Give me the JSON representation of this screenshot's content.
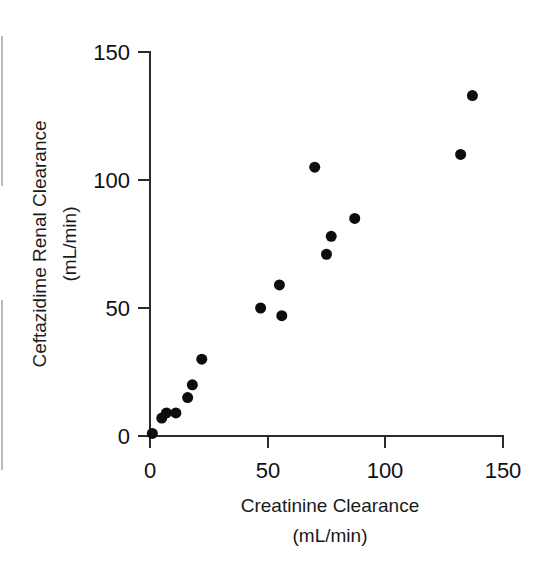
{
  "chart_data": {
    "type": "scatter",
    "title": "",
    "xlabel": "Creatinine Clearance",
    "xlabel_units": "(mL/min)",
    "ylabel": "Ceftazidime Renal Clearance",
    "ylabel_units": "(mL/min)",
    "xlim": [
      0,
      150
    ],
    "ylim": [
      0,
      150
    ],
    "xticks": [
      0,
      50,
      100,
      150
    ],
    "yticks": [
      0,
      50,
      100,
      150
    ],
    "xtick_labels": [
      "0",
      "50",
      "100",
      "150"
    ],
    "ytick_labels": [
      "0",
      "50",
      "100",
      "150"
    ],
    "grid": false,
    "legend": null,
    "marker": "filled-circle",
    "marker_color": "#0d0d0d",
    "marker_size_px": 11,
    "series": [
      {
        "name": "Ceftazidime renal clearance vs creatinine clearance",
        "points": [
          {
            "x": 1,
            "y": 1
          },
          {
            "x": 5,
            "y": 7
          },
          {
            "x": 7,
            "y": 9
          },
          {
            "x": 11,
            "y": 9
          },
          {
            "x": 16,
            "y": 15
          },
          {
            "x": 18,
            "y": 20
          },
          {
            "x": 22,
            "y": 30
          },
          {
            "x": 47,
            "y": 50
          },
          {
            "x": 55,
            "y": 59
          },
          {
            "x": 56,
            "y": 47
          },
          {
            "x": 70,
            "y": 105
          },
          {
            "x": 75,
            "y": 71
          },
          {
            "x": 77,
            "y": 78
          },
          {
            "x": 87,
            "y": 85
          },
          {
            "x": 132,
            "y": 110
          },
          {
            "x": 137,
            "y": 133
          }
        ]
      }
    ]
  },
  "colors": {
    "axis": "#2b2b2b",
    "marker": "#0d0d0d",
    "text": "#111111",
    "background": "#ffffff"
  }
}
